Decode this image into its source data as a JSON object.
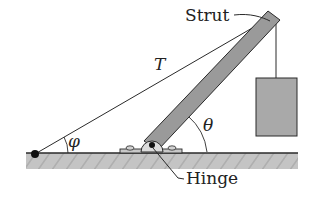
{
  "diagram": {
    "labels": {
      "strut": "Strut",
      "tension": "T",
      "phi": "φ",
      "theta": "θ",
      "hinge": "Hinge"
    },
    "colors": {
      "ground_fill": "#bdbdbd",
      "strut_fill": "#9a9a9a",
      "box_fill": "#a9a9a9",
      "line": "#2a2a2a"
    }
  }
}
